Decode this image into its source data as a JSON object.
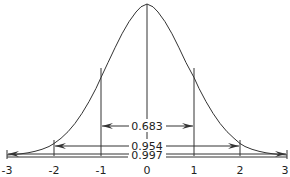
{
  "diagram": {
    "curve": "standard normal bell curve",
    "x_ticks": [
      "-3",
      "-2",
      "-1",
      "0",
      "1",
      "2",
      "3"
    ],
    "intervals": [
      {
        "range": "-1 to 1",
        "label": "0.683"
      },
      {
        "range": "-2 to 2",
        "label": "0.954"
      },
      {
        "range": "-3 to 3",
        "label": "0.997"
      }
    ],
    "line_color": "#333333"
  }
}
